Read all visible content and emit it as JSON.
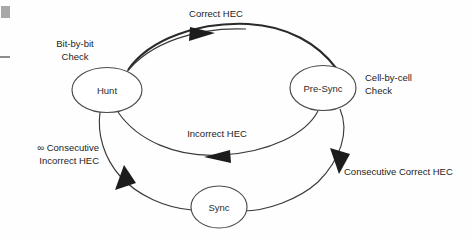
{
  "diagram": {
    "type": "state-transition-diagram",
    "states": [
      {
        "id": "hunt",
        "label": "Hunt",
        "cx": 107,
        "cy": 90,
        "rx": 35,
        "ry": 22.5
      },
      {
        "id": "presync",
        "label": "Pre-Sync",
        "cx": 323,
        "cy": 88,
        "rx": 33,
        "ry": 22.5
      },
      {
        "id": "sync",
        "label": "Sync",
        "cx": 219,
        "cy": 207,
        "rx": 28,
        "ry": 21
      }
    ],
    "transitions": [
      {
        "id": "hunt-to-presync",
        "label": "Correct HEC",
        "from": "hunt",
        "to": "presync"
      },
      {
        "id": "presync-to-hunt",
        "label": "Incorrect HEC",
        "from": "presync",
        "to": "hunt"
      },
      {
        "id": "presync-to-sync",
        "label": "Consecutive Correct HEC",
        "from": "presync",
        "to": "sync"
      },
      {
        "id": "sync-to-hunt",
        "label": "∞ Consecutive",
        "label2": "Incorrect HEC",
        "from": "sync",
        "to": "hunt"
      }
    ],
    "annotations": [
      {
        "id": "hunt-check",
        "line1": "Bit-by-bit",
        "line2": "Check"
      },
      {
        "id": "presync-check",
        "line1": "Cell-by-cell",
        "line2": "Check"
      }
    ],
    "colors": {
      "stroke": "#3a3a3a",
      "thick_stroke": "#2a2a2a",
      "arrow_fill": "#1c1c1c",
      "text": "#242424",
      "background": "#fefefe"
    }
  }
}
